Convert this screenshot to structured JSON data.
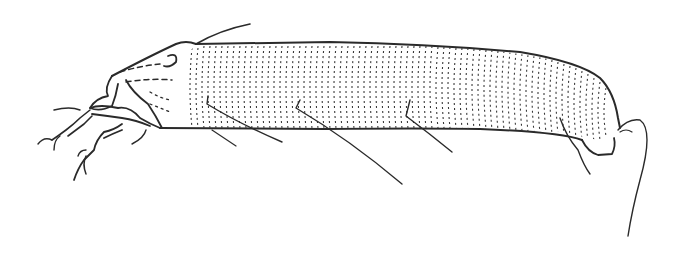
{
  "figure": {
    "background": "#ffffff",
    "ink": "#2a2a2a"
  }
}
